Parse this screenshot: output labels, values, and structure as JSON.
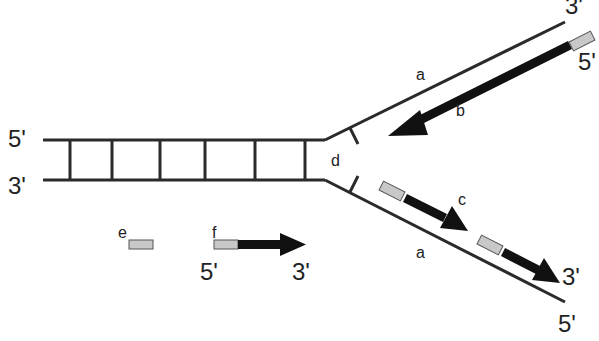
{
  "diagram": {
    "labels": {
      "top_left_5": "5'",
      "top_left_3": "3'",
      "upper_3": "3'",
      "upper_5": "5'",
      "a_upper": "a",
      "b": "b",
      "d": "d",
      "c": "c",
      "a_lower": "a",
      "lower_3": "3'",
      "lower_5": "5'",
      "e": "e",
      "f": "f",
      "legend_5": "5'",
      "legend_3": "3'"
    },
    "colors": {
      "strand": "#2a2a2a",
      "arrow": "#111111",
      "primer": "#c8c8c8"
    }
  }
}
